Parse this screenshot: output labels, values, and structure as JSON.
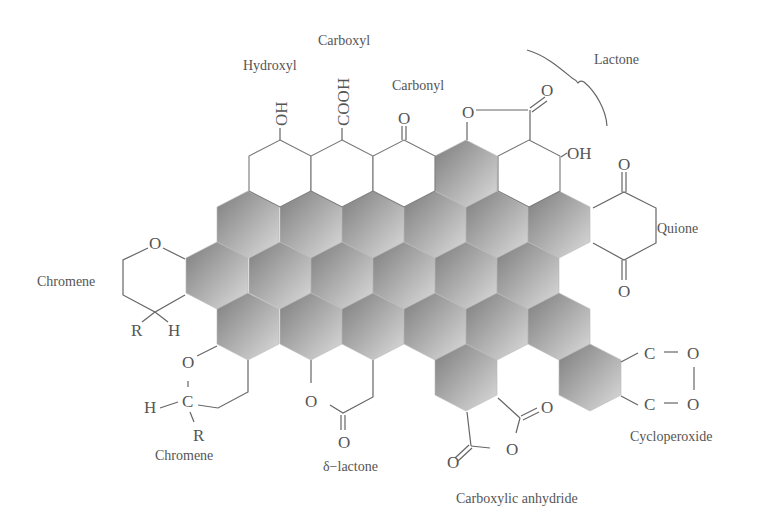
{
  "diagram": {
    "labels": {
      "hydroxyl": "Hydroxyl",
      "carboxyl": "Carboxyl",
      "carbonyl": "Carbonyl",
      "lactone": "Lactone",
      "quinone": "Quione",
      "chromene_top": "Chromene",
      "chromene_bottom": "Chromene",
      "delta_lactone": "δ−lactone",
      "carboxylic_anhydride": "Carboxylic anhydride",
      "cycloperoxide": "Cycloperoxide"
    },
    "atoms": {
      "oh1": "OH",
      "cooh": "COOH",
      "carbonyl_o": "O",
      "lactone_ring_o": "O",
      "lactone_co": "O",
      "oh2": "OH",
      "quinone_o_top": "O",
      "quinone_o_bottom": "O",
      "chromene1_o": "O",
      "chromene1_r": "R",
      "chromene1_h": "H",
      "chromene2_o": "O",
      "chromene2_c": "C",
      "chromene2_h": "H",
      "chromene2_r": "R",
      "dlactone_o": "O",
      "dlactone_co": "O",
      "anhydride_o1": "O",
      "anhydride_o2": "O",
      "anhydride_o3": "O",
      "perox_c1": "C",
      "perox_c2": "C",
      "perox_o1": "O",
      "perox_o2": "O"
    },
    "colors": {
      "shade_dark": "#7a7a7a",
      "shade_light": "#d8d8d8",
      "line": "#666666",
      "text": "#555555"
    }
  }
}
